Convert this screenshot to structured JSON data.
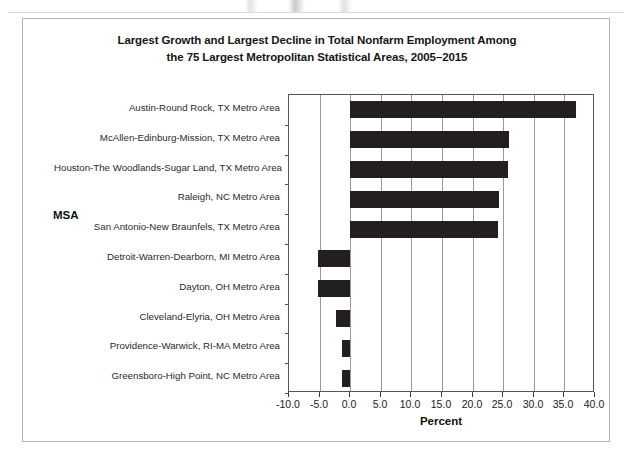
{
  "chart_data": {
    "type": "bar",
    "orientation": "horizontal",
    "title": "Largest Growth and Largest Decline in Total Nonfarm Employment Among the 75 Largest Metropolitan Statistical Areas, 2005–2015",
    "title_lines": [
      "Largest Growth and Largest Decline in Total Nonfarm Employment Among",
      "the 75 Largest Metropolitan Statistical Areas, 2005–2015"
    ],
    "xlabel": "Percent",
    "ylabel": "MSA",
    "xlim": [
      -10.0,
      40.0
    ],
    "xticks": [
      -10.0,
      -5.0,
      0.0,
      5.0,
      10.0,
      15.0,
      20.0,
      25.0,
      30.0,
      35.0,
      40.0
    ],
    "xtick_labels": [
      "-10.0",
      "-5.0",
      "0.0",
      "5.0",
      "10.0",
      "15.0",
      "20.0",
      "25.0",
      "30.0",
      "35.0",
      "40.0"
    ],
    "grid": true,
    "grid_axis": "x",
    "legend": null,
    "bar_color": "#231f20",
    "categories": [
      "Austin-Round Rock, TX Metro Area",
      "McAllen-Edinburg-Mission, TX Metro Area",
      "Houston-The Woodlands-Sugar Land, TX Metro Area",
      "Raleigh, NC Metro Area",
      "San Antonio-New Braunfels, TX Metro Area",
      "Detroit-Warren-Dearborn, MI Metro Area",
      "Dayton, OH Metro Area",
      "Cleveland-Elyria, OH Metro Area",
      "Providence-Warwick, RI-MA Metro Area",
      "Greensboro-High Point, NC Metro Area"
    ],
    "values": [
      36.9,
      26.0,
      25.8,
      24.3,
      24.1,
      -5.2,
      -5.2,
      -2.3,
      -1.4,
      -1.4
    ]
  }
}
